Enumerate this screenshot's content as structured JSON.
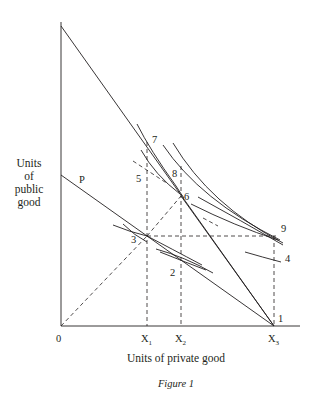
{
  "figure": {
    "caption": "Figure 1",
    "y_axis_label": [
      "Units",
      "of",
      "public",
      "good"
    ],
    "x_axis_label": "Units of private good",
    "origin_label": "0",
    "x_ticks": [
      {
        "label": "X",
        "sub": "1"
      },
      {
        "label": "X",
        "sub": "2"
      },
      {
        "label": "X",
        "sub": "3"
      }
    ],
    "line_labels": {
      "budget_line_lower": "P"
    },
    "point_labels": [
      "1",
      "2",
      "3",
      "4",
      "5",
      "6",
      "7",
      "8",
      "9"
    ],
    "colors": {
      "ink": "#231f20",
      "background": "#ffffff"
    }
  }
}
